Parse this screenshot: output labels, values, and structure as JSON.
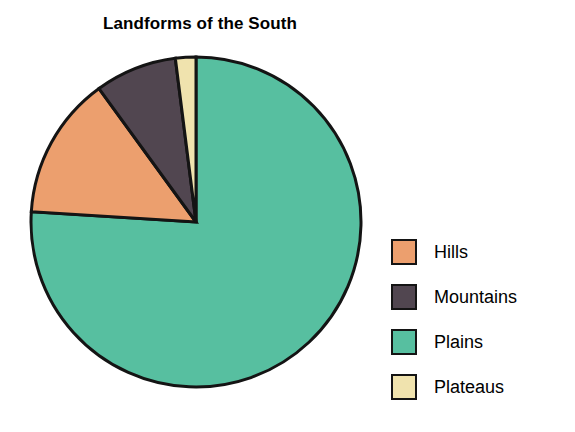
{
  "chart_data": {
    "type": "pie",
    "title": "Landforms of the South",
    "subtitle": "",
    "xlabel": "",
    "ylabel": "",
    "legend_position": "right",
    "grid": false,
    "start_angle_deg": 0,
    "direction": "clockwise",
    "categories": [
      "Plains",
      "Hills",
      "Mountains",
      "Plateaus"
    ],
    "values": [
      76,
      14,
      8,
      2
    ],
    "units": "percent",
    "slices": [
      {
        "label": "Plains",
        "value": 76,
        "color": "#57BFA0",
        "start_deg": 0,
        "end_deg": 273.6
      },
      {
        "label": "Hills",
        "value": 14,
        "color": "#EC9F6E",
        "start_deg": 273.6,
        "end_deg": 324.0
      },
      {
        "label": "Mountains",
        "value": 8,
        "color": "#514650",
        "start_deg": 324.0,
        "end_deg": 352.8
      },
      {
        "label": "Plateaus",
        "value": 2,
        "color": "#F0E3AE",
        "start_deg": 352.8,
        "end_deg": 360.0
      }
    ],
    "outline_color": "#141414"
  },
  "legend": {
    "items": [
      {
        "label": "Hills",
        "color": "#EC9F6E",
        "swatch_name": "legend-swatch-hills"
      },
      {
        "label": "Mountains",
        "color": "#514650",
        "swatch_name": "legend-swatch-mountains"
      },
      {
        "label": "Plains",
        "color": "#57BFA0",
        "swatch_name": "legend-swatch-plains"
      },
      {
        "label": "Plateaus",
        "color": "#F0E3AE",
        "swatch_name": "legend-swatch-plateaus"
      }
    ]
  }
}
